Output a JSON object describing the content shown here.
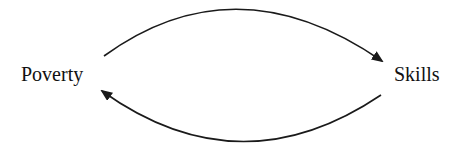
{
  "diagram": {
    "type": "causal-loop",
    "nodes": [
      {
        "id": "poverty",
        "label": "Poverty"
      },
      {
        "id": "skills",
        "label": "Skills"
      }
    ],
    "edges": [
      {
        "from": "poverty",
        "to": "skills",
        "path": "upper-arc"
      },
      {
        "from": "skills",
        "to": "poverty",
        "path": "lower-arc"
      }
    ],
    "colors": {
      "stroke": "#1a1a1a",
      "text": "#111111",
      "background": "#ffffff"
    }
  }
}
